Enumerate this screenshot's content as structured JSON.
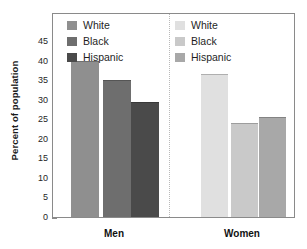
{
  "chart_data": {
    "type": "bar",
    "title": "",
    "xlabel": "",
    "ylabel": "Percent of population",
    "ylim": [
      0,
      47
    ],
    "yticks": [
      0,
      5,
      10,
      15,
      20,
      25,
      30,
      35,
      40,
      45
    ],
    "grid": false,
    "categories": [
      "Men",
      "Women"
    ],
    "series": [
      {
        "name": "White",
        "values": [
          40.0,
          36.5
        ]
      },
      {
        "name": "Black",
        "values": [
          35.0,
          24.0
        ]
      },
      {
        "name": "Hispanic",
        "values": [
          29.5,
          25.5
        ]
      }
    ],
    "legend_position": "inside-top",
    "annotations": [
      "dotted vertical divider between Men and Women groups"
    ]
  },
  "axis": {
    "y_title": "Percent of population",
    "y_ticks": [
      "45",
      "40",
      "35",
      "30",
      "25",
      "20",
      "15",
      "10",
      "5",
      "0"
    ]
  },
  "groups": {
    "men": {
      "label": "Men"
    },
    "women": {
      "label": "Women"
    }
  },
  "legend_men": {
    "items": [
      {
        "label": "White",
        "color": "#8f8f8f"
      },
      {
        "label": "Black",
        "color": "#6e6e6e"
      },
      {
        "label": "Hispanic",
        "color": "#4a4a4a"
      }
    ]
  },
  "legend_women": {
    "items": [
      {
        "label": "White",
        "color": "#e0e0e0"
      },
      {
        "label": "Black",
        "color": "#c9c9c9"
      },
      {
        "label": "Hispanic",
        "color": "#a8a8a8"
      }
    ]
  },
  "bars": {
    "men": [
      {
        "name": "White",
        "value": 40.0,
        "color": "#8f8f8f"
      },
      {
        "name": "Black",
        "value": 35.0,
        "color": "#6e6e6e"
      },
      {
        "name": "Hispanic",
        "value": 29.5,
        "color": "#4a4a4a"
      }
    ],
    "women": [
      {
        "name": "White",
        "value": 36.5,
        "color": "#e0e0e0"
      },
      {
        "name": "Black",
        "value": 24.0,
        "color": "#c9c9c9"
      },
      {
        "name": "Hispanic",
        "value": 25.5,
        "color": "#a8a8a8"
      }
    ]
  }
}
